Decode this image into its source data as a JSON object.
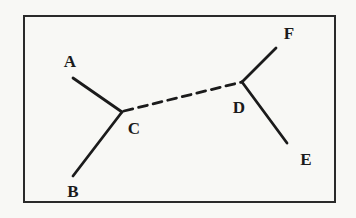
{
  "figure": {
    "background_color": "#f8f8f5",
    "frame_color": "#2a2a2a",
    "line_color": "#1b1b1b",
    "frame": {
      "x": 23,
      "y": 15,
      "width": 313,
      "height": 188
    },
    "canvas": {
      "width": 356,
      "height": 218
    },
    "line_width": 2.8,
    "dash_pattern": "9 6",
    "nodes": [
      {
        "id": "A",
        "label": "A",
        "x": 70,
        "y": 61
      },
      {
        "id": "B",
        "label": "B",
        "x": 73,
        "y": 191
      },
      {
        "id": "C",
        "label": "C",
        "x": 134,
        "y": 128
      },
      {
        "id": "D",
        "label": "D",
        "x": 239,
        "y": 107
      },
      {
        "id": "E",
        "label": "E",
        "x": 306,
        "y": 159
      },
      {
        "id": "F",
        "label": "F",
        "x": 289,
        "y": 33
      }
    ],
    "edges": [
      {
        "from": "A",
        "to": "C",
        "x1": 73,
        "y1": 78,
        "x2": 122,
        "y2": 112,
        "style": "solid"
      },
      {
        "from": "B",
        "to": "C",
        "x1": 73,
        "y1": 176,
        "x2": 122,
        "y2": 112,
        "style": "solid"
      },
      {
        "from": "C",
        "to": "D",
        "x1": 124,
        "y1": 111,
        "x2": 242,
        "y2": 82,
        "style": "dashed"
      },
      {
        "from": "D",
        "to": "F",
        "x1": 242,
        "y1": 82,
        "x2": 276,
        "y2": 48,
        "style": "solid"
      },
      {
        "from": "D",
        "to": "E",
        "x1": 242,
        "y1": 82,
        "x2": 287,
        "y2": 143,
        "style": "solid"
      }
    ]
  }
}
